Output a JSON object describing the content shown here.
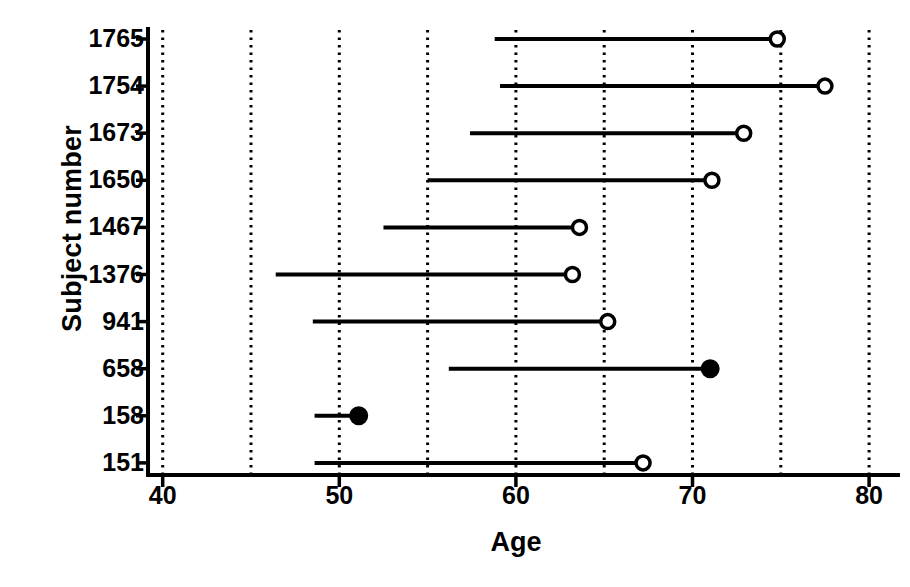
{
  "chart_data": {
    "type": "bar",
    "title": "",
    "xlabel": "Age",
    "ylabel": "Subject number",
    "xlim": [
      40,
      80
    ],
    "ylim": [
      0,
      10
    ],
    "grid": "vertical dotted gridlines at every 5 years",
    "legend": "none",
    "orientation": "horizontal",
    "x_ticks": [
      40,
      50,
      60,
      70,
      80
    ],
    "x_tick_labels": [
      "40",
      "50",
      "60",
      "70",
      "80"
    ],
    "gridlines": [
      40,
      45,
      50,
      55,
      60,
      65,
      70,
      75,
      80
    ],
    "categories": [
      "1765",
      "1754",
      "1673",
      "1650",
      "1467",
      "1376",
      "941",
      "658",
      "158",
      "151"
    ],
    "rows": [
      {
        "subject": "1765",
        "start": 58.8,
        "end": 74.8,
        "marker": "open"
      },
      {
        "subject": "1754",
        "start": 59.1,
        "end": 77.5,
        "marker": "open"
      },
      {
        "subject": "1673",
        "start": 57.4,
        "end": 72.9,
        "marker": "open"
      },
      {
        "subject": "1650",
        "start": 55.0,
        "end": 71.1,
        "marker": "open"
      },
      {
        "subject": "1467",
        "start": 52.5,
        "end": 63.6,
        "marker": "open"
      },
      {
        "subject": "1376",
        "start": 46.4,
        "end": 63.2,
        "marker": "open"
      },
      {
        "subject": "941",
        "start": 48.5,
        "end": 65.2,
        "marker": "open"
      },
      {
        "subject": "658",
        "start": 56.2,
        "end": 71.0,
        "marker": "filled"
      },
      {
        "subject": "158",
        "start": 48.6,
        "end": 51.1,
        "marker": "filled"
      },
      {
        "subject": "151",
        "start": 48.6,
        "end": 67.2,
        "marker": "open"
      }
    ]
  },
  "colors": {
    "ink": "#000000",
    "background": "#ffffff",
    "gridline": "#000000"
  }
}
